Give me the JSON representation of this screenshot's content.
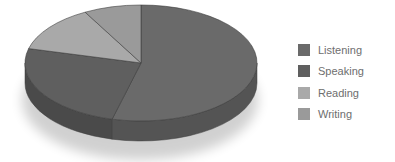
{
  "chart_data": {
    "type": "pie",
    "style": "3d",
    "title": "",
    "categories": [
      "Listening",
      "Speaking",
      "Reading",
      "Writing"
    ],
    "values": [
      54,
      25,
      13,
      8
    ],
    "unit": "%",
    "colors": [
      "#6a6a6a",
      "#5f5f5f",
      "#a9a9a9",
      "#9a9a9a"
    ],
    "side_colors": [
      "#545454",
      "#4a4a4a",
      "#888888",
      "#7d7d7d"
    ],
    "legend_position": "right"
  },
  "legend": {
    "items": [
      {
        "label": "Listening",
        "color": "#6a6a6a"
      },
      {
        "label": "Speaking",
        "color": "#5f5f5f"
      },
      {
        "label": "Reading",
        "color": "#a9a9a9"
      },
      {
        "label": "Writing",
        "color": "#9a9a9a"
      }
    ]
  }
}
